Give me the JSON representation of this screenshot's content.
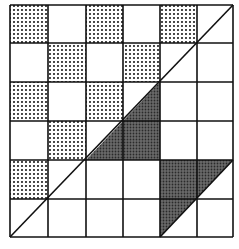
{
  "figure": {
    "grid": {
      "rows": 6,
      "cols": 6,
      "x_lines": [
        10,
        48,
        86,
        123,
        160,
        197,
        233
      ],
      "y_lines": [
        5,
        43,
        82,
        121,
        160,
        199,
        237
      ],
      "line_color": "#111111"
    },
    "dotted_cells": [
      [
        0,
        0
      ],
      [
        0,
        2
      ],
      [
        0,
        4
      ],
      [
        1,
        1
      ],
      [
        1,
        3
      ],
      [
        2,
        0
      ],
      [
        2,
        2
      ],
      [
        3,
        1
      ],
      [
        4,
        0
      ]
    ],
    "dark_regions": [
      {
        "name": "central-triangle",
        "points": [
          [
            86,
            160
          ],
          [
            160,
            82
          ],
          [
            160,
            160
          ]
        ]
      },
      {
        "name": "lower-right-triangle",
        "points": [
          [
            160,
            160
          ],
          [
            233,
            160
          ],
          [
            160,
            237
          ]
        ]
      }
    ],
    "diagonals": [
      {
        "name": "main-diagonal",
        "from": [
          10,
          237
        ],
        "to": [
          233,
          5
        ]
      },
      {
        "name": "secondary-diagonal",
        "from": [
          160,
          237
        ],
        "to": [
          233,
          160
        ]
      }
    ],
    "colors": {
      "dot_fill": "#1a1a1a",
      "dark_fill": "#555555",
      "background": "#ffffff"
    }
  },
  "caption": {
    "text": ""
  }
}
